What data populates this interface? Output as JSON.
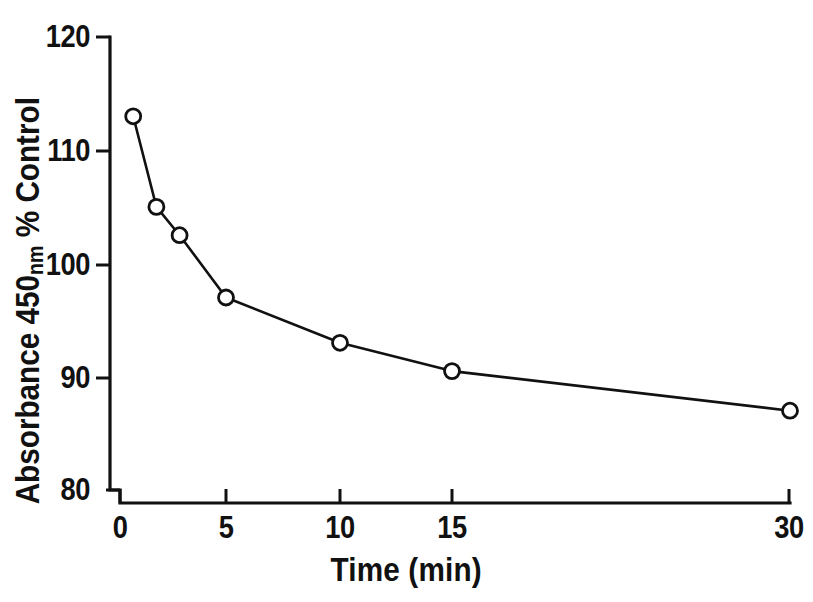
{
  "chart_data": {
    "type": "line",
    "title": "",
    "subtitle": "",
    "xlabel": "Time (min)",
    "ylabel_prefix": "Absorbance 450",
    "ylabel_subscript": "nm",
    "ylabel_suffix": " % Control",
    "ylabel_plain": "Absorbance 450nm % Control",
    "x": [
      1,
      2,
      3,
      5,
      10,
      15,
      30
    ],
    "values": [
      113,
      105,
      102.5,
      97,
      93,
      90.5,
      87
    ],
    "series": [
      {
        "name": "Absorbance 450 nm (% Control)",
        "x": [
          1,
          2,
          3,
          5,
          10,
          15,
          30
        ],
        "values": [
          113,
          105,
          102.5,
          97,
          93,
          90.5,
          87
        ]
      }
    ],
    "xticks": [
      0,
      5,
      10,
      15,
      30
    ],
    "xtick_labels": [
      "0",
      "5",
      "10",
      "15",
      "30"
    ],
    "yticks": [
      80,
      90,
      100,
      110,
      120
    ],
    "ytick_labels": [
      "80",
      "90",
      "100",
      "110",
      "120"
    ],
    "ylim": [
      80,
      120
    ],
    "xlim": [
      0,
      30
    ],
    "x_scale": "non-linear (compressed above 15)",
    "grid": false,
    "legend": false,
    "legend_position": "none",
    "marker": "open-circle",
    "line_color": "#111111",
    "marker_fill": "#ffffff",
    "marker_edge_color": "#111111",
    "background_color": "#ffffff",
    "axis_break": true,
    "annotations": []
  },
  "axis_geometry": {
    "y_axis_x": 110,
    "y_top_y": 37,
    "y_bottom_y": 490,
    "x_axis_y": 503,
    "x_left_x": 110,
    "x_right_x": 790,
    "xtick_px": [
      110,
      226,
      340,
      452,
      790
    ],
    "ytick_px": [
      490,
      378,
      265,
      151,
      37
    ],
    "point_px": [
      {
        "x": 138,
        "y": 117
      },
      {
        "x": 158,
        "y": 207
      },
      {
        "x": 178,
        "y": 235
      },
      {
        "x": 227,
        "y": 297
      },
      {
        "x": 338,
        "y": 342
      },
      {
        "x": 452,
        "y": 371
      },
      {
        "x": 789,
        "y": 414
      }
    ]
  }
}
